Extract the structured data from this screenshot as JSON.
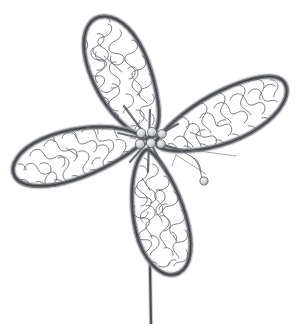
{
  "image": {
    "title": "Four-petal flower line drawing",
    "subject": "stylized flower with four teardrop petals, beaded center, stem and dangling bead wire",
    "style": "black and white line art / coloring-book illustration",
    "background_color": "#ffffff",
    "width": 298,
    "height": 325
  },
  "palette": {
    "background": "#ffffff",
    "outline_dark": "#4c4f54",
    "outline_mid": "#6b6e73",
    "outline_soft": "#9a9da2",
    "squiggle": "#63666b",
    "bead_fill": "#d8d9da",
    "bead_shade": "#a9abae",
    "bead_stroke": "#4e5155",
    "stem": "#5a5d62",
    "petal_fill": "#ffffff"
  },
  "elements": {
    "petals": [
      {
        "id": "petal-top-left",
        "label": "Top left petal",
        "tip_x": 86,
        "tip_y": 16,
        "base_x": 146,
        "base_y": 138,
        "angle_deg": -64
      },
      {
        "id": "petal-right",
        "label": "Right petal",
        "tip_x": 283,
        "tip_y": 80,
        "base_x": 155,
        "base_y": 140,
        "angle_deg": 25
      },
      {
        "id": "petal-left",
        "label": "Left petal",
        "tip_x": 14,
        "tip_y": 152,
        "base_x": 141,
        "base_y": 142,
        "angle_deg": 186
      },
      {
        "id": "petal-bottom",
        "label": "Bottom petal",
        "tip_x": 184,
        "tip_y": 272,
        "base_x": 148,
        "base_y": 148,
        "angle_deg": 104
      }
    ],
    "center": {
      "id": "center-beads",
      "label": "Beaded flower center",
      "x": 149,
      "y": 140,
      "bead_count": 6,
      "bead_radius": 4.6
    },
    "stem": {
      "id": "stem",
      "label": "Stem",
      "top_x": 147,
      "top_y": 150,
      "bottom_x": 150,
      "bottom_y": 325,
      "width": 2.4
    },
    "dangle": {
      "id": "dangle-bead-wire",
      "label": "Wire loop with hanging bead",
      "bead_x": 204,
      "bead_y": 181,
      "bead_radius": 4.0
    },
    "whiskers": [
      {
        "id": "whisker-right",
        "label": "Right whisker line"
      },
      {
        "id": "whisker-down",
        "label": "Lower whisker line"
      },
      {
        "id": "whisker-inner",
        "label": "Inner petal vein line"
      }
    ]
  },
  "accessibility": {
    "alt_text": "A simple black and white line drawing of a flower with four rounded teardrop petals arranged around a small cluster of beads. Each petal is filled with dense wandering squiggle lines. A straight stem drops from the center to the bottom edge, and a thin looping wire with a small round bead hangs to the right of the center."
  }
}
